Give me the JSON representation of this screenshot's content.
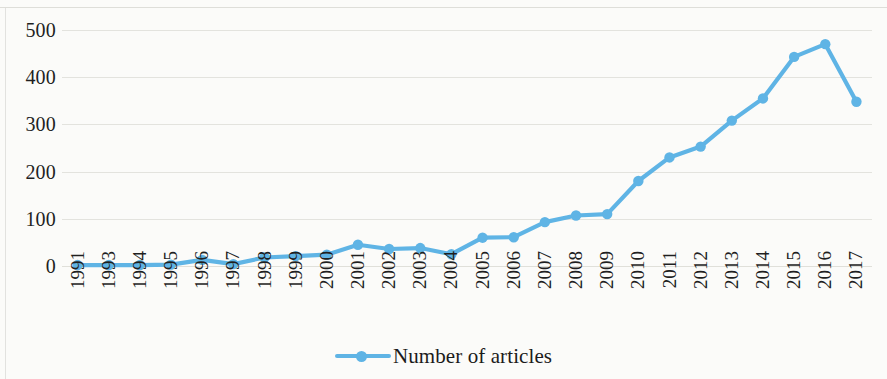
{
  "chart_data": {
    "type": "line",
    "title": "",
    "subtitle": "",
    "xlabel": "",
    "ylabel": "",
    "categories": [
      "1991",
      "1993",
      "1994",
      "1995",
      "1996",
      "1997",
      "1998",
      "1999",
      "2000",
      "2001",
      "2002",
      "2003",
      "2004",
      "2005",
      "2006",
      "2007",
      "2008",
      "2009",
      "2010",
      "2011",
      "2012",
      "2013",
      "2014",
      "2015",
      "2016",
      "2017"
    ],
    "series": [
      {
        "name": "Number of articles",
        "color": "#5FB4E5",
        "marker": "circle",
        "values": [
          2,
          2,
          2,
          3,
          13,
          4,
          18,
          21,
          24,
          45,
          36,
          38,
          25,
          60,
          61,
          93,
          107,
          110,
          180,
          230,
          253,
          308,
          355,
          443,
          470,
          348
        ]
      }
    ],
    "ylim": [
      0,
      500
    ],
    "yticks": [
      0,
      100,
      200,
      300,
      400,
      500
    ],
    "ytick_labels": [
      "0",
      "100",
      "200",
      "300",
      "400",
      "500"
    ],
    "grid": true,
    "grid_axis": "y",
    "legend_position": "bottom",
    "legend_entries": [
      "Number of articles"
    ]
  },
  "colors": {
    "series": "#5FB4E5",
    "gridline": "#e3e3de",
    "text": "#1f1f1f",
    "background": "#fbfbf9"
  }
}
